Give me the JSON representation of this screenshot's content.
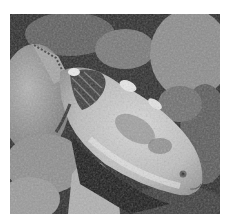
{
  "image": {
    "description": "Grayscale underwater photograph of a parrotfish swimming over a coral reef",
    "subject": "fish",
    "setting": "coral reef",
    "color_mode": "grayscale",
    "colors": {
      "background": "#ffffff",
      "reef_dark": "#1e1e1e",
      "reef_mid": "#6e6e6e",
      "rock_light": "#a8a8a8",
      "fish_body": "#c9c9c9",
      "fish_highlight": "#e6e6e6",
      "fish_dark_pattern": "#3a3a3a"
    }
  }
}
